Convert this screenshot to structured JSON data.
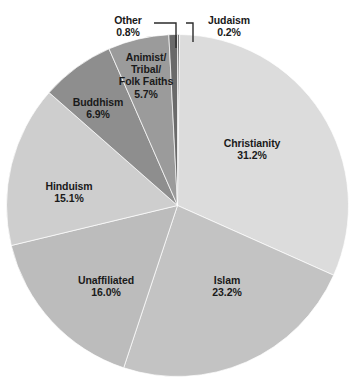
{
  "chart_data": {
    "type": "pie",
    "title": "",
    "subtitle": "",
    "xlabel": "",
    "ylabel": "",
    "legend_position": "none",
    "grid": false,
    "units": "percent",
    "start_angle_deg": 0,
    "direction": "clockwise",
    "categories": [
      "Judaism",
      "Christianity",
      "Islam",
      "Unaffiliated",
      "Hinduism",
      "Buddhism",
      "Animist/Tribal/Folk Faiths",
      "Other"
    ],
    "values": [
      0.2,
      31.2,
      23.2,
      16.0,
      15.1,
      6.9,
      5.7,
      0.8
    ],
    "slices": [
      {
        "name": "Judaism",
        "label_line1": "Judaism",
        "label_line2": "",
        "label_line3": "",
        "value": 0.2,
        "value_label": "0.2%",
        "color": "#7d7d7d",
        "label_placement": "outside-leader"
      },
      {
        "name": "Christianity",
        "label_line1": "Christianity",
        "label_line2": "",
        "label_line3": "",
        "value": 31.2,
        "value_label": "31.2%",
        "color": "#dcdcdc",
        "label_placement": "inside"
      },
      {
        "name": "Islam",
        "label_line1": "Islam",
        "label_line2": "",
        "label_line3": "",
        "value": 23.2,
        "value_label": "23.2%",
        "color": "#c3c3c3",
        "label_placement": "inside"
      },
      {
        "name": "Unaffiliated",
        "label_line1": "Unaffiliated",
        "label_line2": "",
        "label_line3": "",
        "value": 16.0,
        "value_label": "16.0%",
        "color": "#bcbcbc",
        "label_placement": "inside"
      },
      {
        "name": "Hinduism",
        "label_line1": "Hinduism",
        "label_line2": "",
        "label_line3": "",
        "value": 15.1,
        "value_label": "15.1%",
        "color": "#cecece",
        "label_placement": "inside"
      },
      {
        "name": "Buddhism",
        "label_line1": "Buddhism",
        "label_line2": "",
        "label_line3": "",
        "value": 6.9,
        "value_label": "6.9%",
        "color": "#8e8e8e",
        "label_placement": "inside"
      },
      {
        "name": "Animist/Tribal/Folk Faiths",
        "label_line1": "Animist/",
        "label_line2": "Tribal/",
        "label_line3": "Folk Faiths",
        "value": 5.7,
        "value_label": "5.7%",
        "color": "#9b9b9b",
        "label_placement": "inside"
      },
      {
        "name": "Other",
        "label_line1": "Other",
        "label_line2": "",
        "label_line3": "",
        "value": 0.8,
        "value_label": "0.8%",
        "color": "#6a6a6a",
        "label_placement": "outside-leader"
      }
    ]
  },
  "style": {
    "background": "#ffffff",
    "text_color": "#1a1a1a",
    "leader_line_color": "#2b2b2b",
    "slice_border_color": "#ffffff"
  }
}
